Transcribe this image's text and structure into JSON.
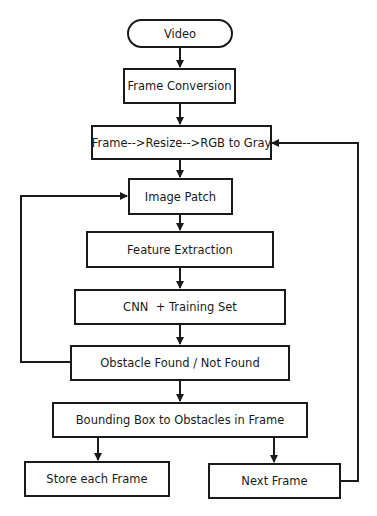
{
  "diagram": {
    "type": "flowchart",
    "nodes": [
      {
        "id": "video",
        "label": "Video",
        "shape": "terminator"
      },
      {
        "id": "frame_conversion",
        "label": "Frame Conversion",
        "shape": "process"
      },
      {
        "id": "preprocess",
        "label": "Frame-->Resize-->RGB to Gray",
        "shape": "process"
      },
      {
        "id": "image_patch",
        "label": "Image Patch",
        "shape": "process"
      },
      {
        "id": "feature_extraction",
        "label": "Feature Extraction",
        "shape": "process"
      },
      {
        "id": "cnn",
        "label": "CNN  + Training Set",
        "shape": "process"
      },
      {
        "id": "obstacle",
        "label": "Obstacle Found / Not Found",
        "shape": "process"
      },
      {
        "id": "bounding_box",
        "label": "Bounding Box to Obstacles in Frame",
        "shape": "process"
      },
      {
        "id": "store",
        "label": "Store each Frame",
        "shape": "process"
      },
      {
        "id": "next",
        "label": "Next Frame",
        "shape": "process"
      }
    ],
    "edges": [
      {
        "from": "video",
        "to": "frame_conversion"
      },
      {
        "from": "frame_conversion",
        "to": "preprocess"
      },
      {
        "from": "preprocess",
        "to": "image_patch"
      },
      {
        "from": "image_patch",
        "to": "feature_extraction"
      },
      {
        "from": "feature_extraction",
        "to": "cnn"
      },
      {
        "from": "cnn",
        "to": "obstacle"
      },
      {
        "from": "obstacle",
        "to": "image_patch",
        "route": "left-loop"
      },
      {
        "from": "obstacle",
        "to": "bounding_box"
      },
      {
        "from": "bounding_box",
        "to": "store"
      },
      {
        "from": "bounding_box",
        "to": "next"
      },
      {
        "from": "next",
        "to": "preprocess",
        "route": "right-loop"
      }
    ],
    "colors": {
      "stroke": "#1a1a1a",
      "fill": "#ffffff"
    }
  }
}
